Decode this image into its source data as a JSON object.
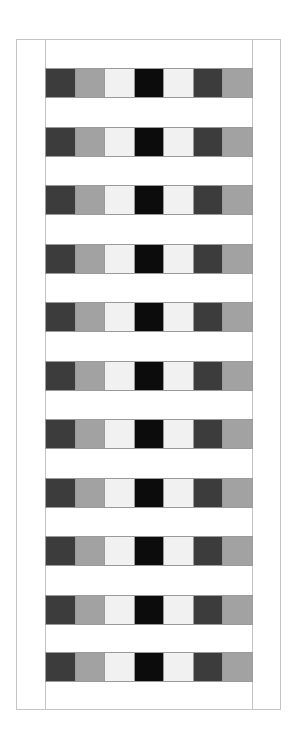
{
  "pattern": {
    "colors": {
      "dark": "#3c3c3c",
      "mid": "#a2a2a2",
      "light": "#f1f1f1",
      "black": "#0c0c0c",
      "frame": "#c4c4c4"
    },
    "tile_sequence": [
      "dark",
      "mid",
      "light",
      "black",
      "light",
      "dark",
      "mid"
    ],
    "row_tops": [
      68,
      127,
      185,
      244,
      302,
      361,
      419,
      478,
      536,
      595,
      652
    ]
  }
}
